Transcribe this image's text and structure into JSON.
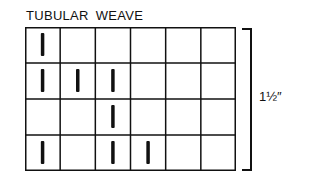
{
  "title": "TUBULAR WEAVE",
  "measurement_label": "1½″",
  "grid": {
    "rows": 4,
    "cols": 6,
    "marks": [
      [
        1,
        0,
        0,
        0,
        0,
        0
      ],
      [
        1,
        1,
        1,
        0,
        0,
        0
      ],
      [
        0,
        0,
        1,
        0,
        0,
        0
      ],
      [
        1,
        0,
        1,
        1,
        0,
        0
      ]
    ]
  },
  "colors": {
    "line": "#111111",
    "mark": "#111111",
    "background": "#ffffff"
  }
}
